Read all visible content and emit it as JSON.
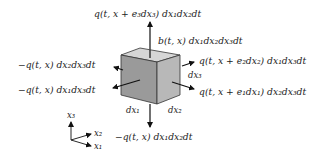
{
  "figure": {
    "colors": {
      "front_face": "#9a9a9a",
      "right_face": "#b8b8b8",
      "top_face": "#d6d6d6",
      "edges": "#333333",
      "arrows": "#111111"
    },
    "labels": {
      "top_flux": "q(t, x + e₃dx₃) dx₁dx₂dt",
      "source": "b(t, x) dx₁dx₂dx₃dt",
      "right_flux_e2": "q(t, x + e₂dx₂) dx₁dx₃dt",
      "right_flux_e1": "q(t, x + e₁dx₁) dx₂dx₃dt",
      "left_flux_x1": "−q(t, x) dx₂dx₃dt",
      "left_flux_x2": "−q(t, x) dx₁dx₃dt",
      "bottom_flux": "−q(t, x) dx₁dx₂dt",
      "edge_dx1": "dx₁",
      "edge_dx2": "dx₂",
      "edge_dx3": "dx₃"
    },
    "axes": {
      "x3": "x₃",
      "x2": "x₂",
      "x1": "x₁"
    }
  }
}
